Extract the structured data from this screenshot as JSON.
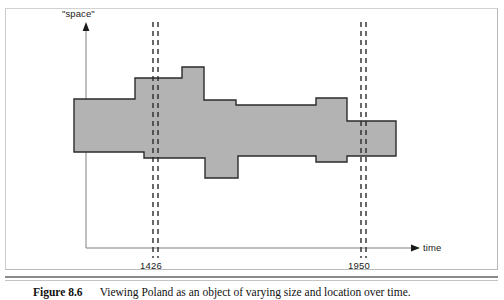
{
  "figure": {
    "number_label": "Figure 8.6",
    "caption_text": "Viewing Poland as an object of varying size and location over time."
  },
  "axes": {
    "y_label": "\"space\"",
    "x_label": "time",
    "x_origin_px": 86,
    "x_end_px": 420,
    "y_top_px": 25,
    "y_baseline_px": 248,
    "axis_color": "#808080",
    "arrow_color": "#1a1a1a"
  },
  "time_markers": [
    {
      "name": "marker-1426",
      "label": "1426",
      "x_px": 155,
      "line_offsets": [
        -2,
        3
      ]
    },
    {
      "name": "marker-1950",
      "label": "1950",
      "x_px": 363,
      "line_offsets": [
        -2,
        3
      ]
    }
  ],
  "marker_style": {
    "color": "#2b2b2b",
    "dash": "5 4",
    "width": 1.4,
    "y_top_px": 22,
    "y_bottom_px": 258
  },
  "chart_data": {
    "type": "area",
    "title": "Viewing Poland as an object of varying size and location over time.",
    "xlabel": "time",
    "ylabel": "\"space\"",
    "grid": false,
    "legend": null,
    "annotations": [
      "1426",
      "1950"
    ],
    "fill_color": "#b3b3b3",
    "stroke_color": "#2b2b2b",
    "stroke_width": 1.4,
    "polygon_points_px": "74,99 135,99 135,78 182,78 182,67 204,67 204,100 236,100 236,105 316,105 316,98 347,98 347,121 396,121 396,156 347,156 347,162 316,162 316,156 238,156 238,178 205,178 205,158 144,158 144,152 74,152",
    "upper_boundary_steps": [
      {
        "x_from": 74,
        "x_to": 135,
        "y": 99
      },
      {
        "x_from": 135,
        "x_to": 182,
        "y": 78
      },
      {
        "x_from": 182,
        "x_to": 204,
        "y": 67
      },
      {
        "x_from": 204,
        "x_to": 236,
        "y": 100
      },
      {
        "x_from": 236,
        "x_to": 316,
        "y": 105
      },
      {
        "x_from": 316,
        "x_to": 347,
        "y": 98
      },
      {
        "x_from": 347,
        "x_to": 396,
        "y": 121
      }
    ],
    "lower_boundary_steps": [
      {
        "x_from": 74,
        "x_to": 144,
        "y": 152
      },
      {
        "x_from": 144,
        "x_to": 205,
        "y": 158
      },
      {
        "x_from": 205,
        "x_to": 238,
        "y": 178
      },
      {
        "x_from": 238,
        "x_to": 316,
        "y": 156
      },
      {
        "x_from": 316,
        "x_to": 347,
        "y": 162
      },
      {
        "x_from": 347,
        "x_to": 396,
        "y": 156
      }
    ]
  },
  "frame": {
    "border_color": "#b9b9b9",
    "background": "#ffffff"
  },
  "separators": {
    "thick_color": "#8a8a8a",
    "thin_color": "#c4c4c4"
  }
}
